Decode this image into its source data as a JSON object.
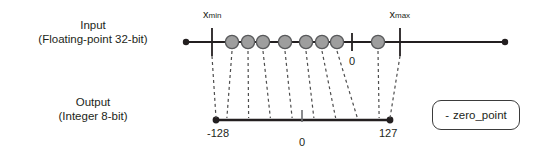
{
  "diagram": {
    "rows": [
      {
        "name": "input",
        "line1": "Input",
        "line2": "(Floating-point 32-bit)"
      },
      {
        "name": "output",
        "line1": "Output",
        "line2": "(Integer 8-bit)"
      }
    ],
    "input_axis": {
      "ticks": [
        {
          "id": "xmin",
          "base": "x",
          "subscript": "min",
          "x": 212
        },
        {
          "id": "zero",
          "base": "0",
          "subscript": "",
          "x": 352
        },
        {
          "id": "xmax",
          "base": "x",
          "subscript": "max",
          "x": 400
        }
      ],
      "endpoint_left_x": 186,
      "endpoint_right_x": 505,
      "points_x": [
        232,
        248,
        263,
        285,
        306,
        322,
        337,
        378
      ]
    },
    "output_axis": {
      "min_label": "-128",
      "zero_label": "0",
      "max_label": "127",
      "left_x": 216,
      "right_x": 390,
      "zero_x": 302
    },
    "legend": {
      "marker": "-",
      "label": "zero_point"
    },
    "colors": {
      "line": "#231f20",
      "point_fill": "#9e9e9e",
      "point_stroke": "#58595b",
      "dash": "#4d4d4d",
      "legend_border": "#3b3b3b"
    }
  }
}
